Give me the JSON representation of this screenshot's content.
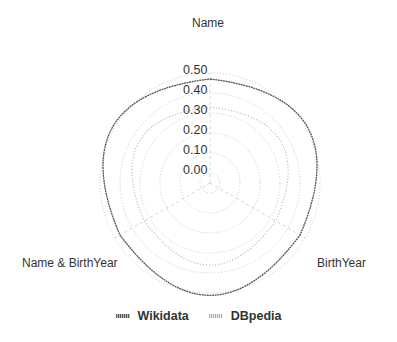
{
  "chart_data": {
    "type": "radar",
    "title": "",
    "axes": [
      "Name",
      "BirthYear",
      "Name & BirthYear"
    ],
    "radial_ticks": [
      "0.00",
      "0.10",
      "0.20",
      "0.30",
      "0.40",
      "0.50"
    ],
    "rlim": [
      0,
      0.5
    ],
    "grid": true,
    "line_shape": "spline",
    "legend_position": "bottom",
    "series": [
      {
        "name": "Wikidata",
        "values": [
          0.47,
          0.47,
          0.47
        ],
        "color": "#555555",
        "dash": "dotted-dense"
      },
      {
        "name": "DBpedia",
        "values": [
          0.33,
          0.33,
          0.33
        ],
        "color": "#bbbbbb",
        "dash": "dotted"
      }
    ]
  },
  "labels": {
    "axis_top": "Name",
    "axis_right": "BirthYear",
    "axis_left": "Name & BirthYear"
  },
  "legend": {
    "wikidata": "Wikidata",
    "dbpedia": "DBpedia"
  }
}
